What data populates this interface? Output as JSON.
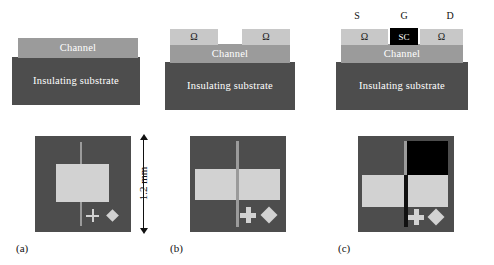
{
  "figure": {
    "colors": {
      "substrate": "#4d4d4d",
      "channel": "#9b9b9b",
      "ohmic_contact": "#c8c8c8",
      "semiconductor_gate": "#000000",
      "pad": "#d2d2d2",
      "background": "#ffffff",
      "text_dark": "#111111",
      "text_light": "#ffffff"
    },
    "dimension": {
      "value": "1.2 mm"
    },
    "panels": [
      {
        "id": "a",
        "caption": "(a)",
        "cross_section": {
          "substrate_label": "Insulating substrate",
          "channel_label": "Channel",
          "contacts": [],
          "gate": null,
          "terminals": []
        },
        "top_view": {
          "pads": [
            "single-channel-pad"
          ],
          "gate_pad": null,
          "markers": [
            "cross",
            "diamond"
          ],
          "scribe_line": "light"
        }
      },
      {
        "id": "b",
        "caption": "(b)",
        "cross_section": {
          "substrate_label": "Insulating substrate",
          "channel_label": "Channel",
          "contacts": [
            "Ω",
            "Ω"
          ],
          "gate": null,
          "terminals": []
        },
        "top_view": {
          "pads": [
            "left-ohmic-pad",
            "right-ohmic-pad"
          ],
          "gate_pad": null,
          "markers": [
            "cross",
            "diamond"
          ],
          "scribe_line": "light"
        }
      },
      {
        "id": "c",
        "caption": "(c)",
        "cross_section": {
          "substrate_label": "Insulating substrate",
          "channel_label": "Channel",
          "contacts": [
            "Ω",
            "Ω"
          ],
          "gate": "SC",
          "terminals": [
            "S",
            "G",
            "D"
          ]
        },
        "top_view": {
          "pads": [
            "left-ohmic-pad",
            "right-ohmic-pad"
          ],
          "gate_pad": "semiconductor-gate-pad",
          "markers": [
            "cross",
            "diamond"
          ],
          "scribe_line": "dark"
        }
      }
    ]
  }
}
